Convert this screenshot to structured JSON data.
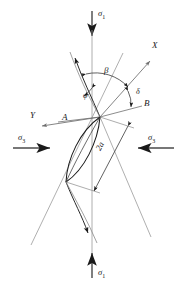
{
  "figure": {
    "type": "mechanics-diagram",
    "background": "#ffffff",
    "stroke_dark": "#1a1a1a",
    "stroke_gray": "#8a8a8a",
    "width": 187,
    "height": 288
  },
  "labels": {
    "sigma1_top": "σ",
    "sigma1_top_sub": "1",
    "sigma1_bottom": "σ",
    "sigma1_bottom_sub": "1",
    "sigma3_left": "σ",
    "sigma3_left_sub": "3",
    "sigma3_right": "σ",
    "sigma3_right_sub": "3",
    "axis_x": "X",
    "axis_y": "Y",
    "angle_beta": "β",
    "angle_phi": "φ",
    "angle_delta": "δ",
    "point_a": "A",
    "point_b": "B",
    "dimension_2a": "2a"
  },
  "geometry": {
    "node": {
      "x": 100,
      "y": 117
    },
    "lens_lower": {
      "x": 66,
      "y": 182
    },
    "vertical_axis_x": 92,
    "x_axis_arrow": {
      "x": 152,
      "y": 58
    },
    "y_axis_arrow": {
      "x": 38,
      "y": 124
    },
    "wing_upper_arrow": {
      "x": 74,
      "y": 55
    },
    "wing_lower_arrow": {
      "x": 88,
      "y": 235
    },
    "sigma3_left_arrow_y": 148,
    "sigma3_right_arrow_y": 148
  }
}
